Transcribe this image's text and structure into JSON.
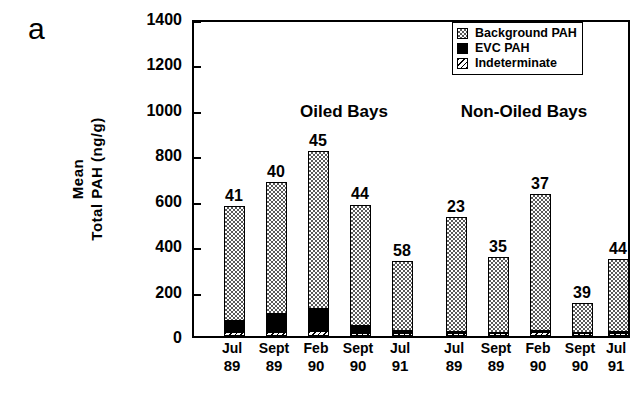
{
  "panel": {
    "letter": "a"
  },
  "axes": {
    "ylabel_line1": "Mean",
    "ylabel_line2": "Total PAH (ng/g)",
    "yticks": [
      "0",
      "200",
      "400",
      "600",
      "800",
      "1000",
      "1200",
      "1400"
    ]
  },
  "legend": {
    "items": [
      {
        "key": "background",
        "label": "Background PAH"
      },
      {
        "key": "evc",
        "label": "EVC PAH"
      },
      {
        "key": "indeterminate",
        "label": "Indeterminate"
      }
    ]
  },
  "groups": [
    {
      "title": "Oiled Bays"
    },
    {
      "title": "Non-Oiled Bays"
    }
  ],
  "chart_data": {
    "type": "bar",
    "title": "",
    "subtitle": "",
    "xlabel": "",
    "ylabel": "Mean Total PAH (ng/g)",
    "ylim": [
      0,
      1400
    ],
    "ytick_step": 200,
    "grid": false,
    "stacked": true,
    "legend_position": "top-right",
    "series": [
      {
        "name": "Indeterminate",
        "values": [
          18,
          18,
          22,
          14,
          12,
          14,
          12,
          16,
          12,
          14
        ]
      },
      {
        "name": "EVC PAH",
        "values": [
          48,
          80,
          98,
          30,
          10,
          4,
          3,
          6,
          3,
          4
        ]
      },
      {
        "name": "Background PAH",
        "values": [
          505,
          580,
          695,
          535,
          310,
          505,
          335,
          605,
          130,
          320
        ]
      }
    ],
    "groups": [
      {
        "name": "Oiled Bays",
        "categories": [
          "Jul 89",
          "Sept 89",
          "Feb 90",
          "Sept 90",
          "Jul 91"
        ],
        "totals": [
          571,
          678,
          815,
          579,
          332
        ],
        "data_labels": [
          "41",
          "40",
          "45",
          "44",
          "58"
        ]
      },
      {
        "name": "Non-Oiled Bays",
        "categories": [
          "Jul 89",
          "Sept 89",
          "Feb 90",
          "Sept 90",
          "Jul 91"
        ],
        "totals": [
          523,
          350,
          627,
          145,
          338
        ],
        "data_labels": [
          "23",
          "35",
          "37",
          "39",
          "44"
        ]
      }
    ],
    "bars": [
      {
        "group": 0,
        "month": "Jul",
        "year": "89",
        "label": "41",
        "indeterminate": 18,
        "evc": 48,
        "background": 505,
        "total": 571
      },
      {
        "group": 0,
        "month": "Sept",
        "year": "89",
        "label": "40",
        "indeterminate": 18,
        "evc": 80,
        "background": 580,
        "total": 678
      },
      {
        "group": 0,
        "month": "Feb",
        "year": "90",
        "label": "45",
        "indeterminate": 22,
        "evc": 98,
        "background": 695,
        "total": 815
      },
      {
        "group": 0,
        "month": "Sept",
        "year": "90",
        "label": "44",
        "indeterminate": 14,
        "evc": 30,
        "background": 535,
        "total": 579
      },
      {
        "group": 0,
        "month": "Jul",
        "year": "91",
        "label": "58",
        "indeterminate": 12,
        "evc": 10,
        "background": 310,
        "total": 332
      },
      {
        "group": 1,
        "month": "Jul",
        "year": "89",
        "label": "23",
        "indeterminate": 14,
        "evc": 4,
        "background": 505,
        "total": 523
      },
      {
        "group": 1,
        "month": "Sept",
        "year": "89",
        "label": "35",
        "indeterminate": 12,
        "evc": 3,
        "background": 335,
        "total": 350
      },
      {
        "group": 1,
        "month": "Feb",
        "year": "90",
        "label": "37",
        "indeterminate": 16,
        "evc": 6,
        "background": 605,
        "total": 627
      },
      {
        "group": 1,
        "month": "Sept",
        "year": "90",
        "label": "39",
        "indeterminate": 12,
        "evc": 3,
        "background": 130,
        "total": 145
      },
      {
        "group": 1,
        "month": "Jul",
        "year": "91",
        "label": "44",
        "indeterminate": 14,
        "evc": 4,
        "background": 320,
        "total": 338
      }
    ]
  }
}
